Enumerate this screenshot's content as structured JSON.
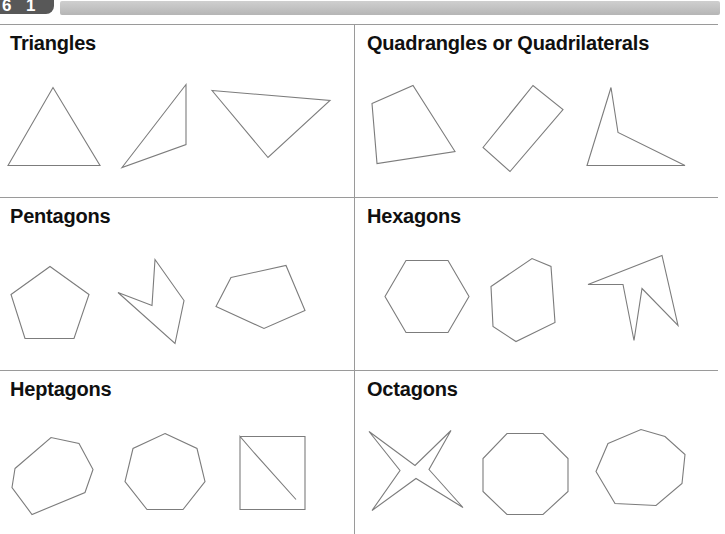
{
  "header": {
    "page_badge": {
      "digit_left": "6",
      "digit_right": "1"
    },
    "strip_color": "#c4c4c4"
  },
  "worksheet": {
    "stroke_color": "#7c7c7c",
    "rule_color": "#9a9a9a",
    "cells": [
      {
        "id": "triangles",
        "title": "Triangles",
        "shapes": [
          {
            "name": "equilateral-triangle",
            "sides": 3,
            "points": "8,90 53,12 100,90"
          },
          {
            "name": "thin-scalene-triangle",
            "sides": 3,
            "points": "122,92 186,9 186,69"
          },
          {
            "name": "obtuse-triangle",
            "sides": 3,
            "points": "212,15 330,25 268,82"
          }
        ]
      },
      {
        "id": "quadrangles",
        "title": "Quadrangles or Quadrilaterals",
        "shapes": [
          {
            "name": "irregular-quadrilateral",
            "sides": 4,
            "points": "17,28 58,10 100,76 22,88"
          },
          {
            "name": "tilted-rectangle",
            "sides": 4,
            "points": "128,72 178,10 208,34 155,96"
          },
          {
            "name": "concave-dart-quadrilateral",
            "sides": 4,
            "points": "256,12 232,90 330,90 263,57"
          }
        ]
      },
      {
        "id": "pentagons",
        "title": "Pentagons",
        "shapes": [
          {
            "name": "regular-pentagon",
            "sides": 5,
            "points": "50,18 89,46 74,90 25,90 11,46"
          },
          {
            "name": "concave-zigzag-pentagon",
            "sides": 5,
            "points": "155,11 184,52 175,95 118,44 152,57"
          },
          {
            "name": "irregular-pentagon",
            "sides": 5,
            "points": "231,29 286,17 305,62 264,80 216,58"
          }
        ]
      },
      {
        "id": "hexagons",
        "title": "Hexagons",
        "shapes": [
          {
            "name": "regular-hexagon",
            "sides": 6,
            "points": "30,48 51,12 93,12 114,48 93,84 51,84"
          },
          {
            "name": "irregular-hexagon",
            "sides": 6,
            "points": "136,38 177,10 196,18 200,74 161,93 138,78"
          },
          {
            "name": "concave-spiky-hexagon",
            "sides": 6,
            "points": "233,36 307,7 323,77 287,40 279,92 268,36"
          }
        ]
      },
      {
        "id": "heptagons",
        "title": "Heptagons",
        "shapes": [
          {
            "name": "irregular-heptagon",
            "sides": 7,
            "points": "15,47 51,16 79,22 93,48 85,71 32,93 12,66"
          },
          {
            "name": "regular-heptagon",
            "sides": 7,
            "points": "165,12 197,27 205,60 183,88 147,88 125,60 133,27"
          },
          {
            "name": "concave-notched-heptagon",
            "sides": 7,
            "points": "240,15 305,15 305,88 240,88 240,15 253,30 296,78"
          }
        ]
      },
      {
        "id": "octagons",
        "title": "Octagons",
        "shapes": [
          {
            "name": "four-pointed-star-octagon",
            "sides": 8,
            "points": "14,10 60,44 96,9 74,48 108,86 61,57 17,89 45,49"
          },
          {
            "name": "regular-octagon",
            "sides": 8,
            "points": "152,12 188,12 213,37 213,70 188,93 152,93 128,70 128,37"
          },
          {
            "name": "irregular-octagon",
            "sides": 8,
            "points": "253,22 286,8 310,15 330,33 327,62 301,84 260,82 241,50"
          }
        ]
      }
    ]
  }
}
